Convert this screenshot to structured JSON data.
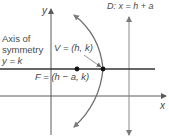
{
  "figure": {
    "type": "parabola-diagram",
    "colors": {
      "axes": "#5a5a5a",
      "axis_of_symmetry": "#333333",
      "parabola": "#6e6e6e",
      "directrix": "#8a8a8a",
      "points": "#111111",
      "text": "#4a4a4a"
    },
    "labels": {
      "y_axis": "y",
      "x_axis": "x",
      "directrix": "D: x = h + a",
      "axis_of_symmetry_line1": "Axis of",
      "axis_of_symmetry_line2": "symmetry",
      "axis_of_symmetry_line3": "y = k",
      "vertex": "V = (h, k)",
      "focus": "F = (h − a, k)"
    },
    "points": {
      "vertex": {
        "name": "V",
        "coords": "(h, k)"
      },
      "focus": {
        "name": "F",
        "coords": "(h − a, k)"
      }
    },
    "lines": {
      "directrix": {
        "name": "D",
        "equation": "x = h + a"
      },
      "axis_of_symmetry": {
        "equation": "y = k"
      }
    }
  }
}
